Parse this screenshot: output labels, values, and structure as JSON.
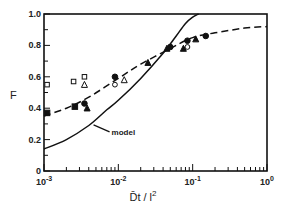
{
  "chart_data": {
    "type": "scatter",
    "title": "",
    "xlabel": "D̄t / l²",
    "ylabel": "F",
    "xscale": "log",
    "xlim": [
      0.001,
      1.0
    ],
    "ylim": [
      0,
      1.0
    ],
    "grid": false,
    "legend": null,
    "x_tick_labels": [
      {
        "value": 0.001,
        "base": "10",
        "exp": "-3"
      },
      {
        "value": 0.01,
        "base": "10",
        "exp": "-2"
      },
      {
        "value": 0.1,
        "base": "10",
        "exp": "-1"
      },
      {
        "value": 1.0,
        "base": "10",
        "exp": "0"
      }
    ],
    "y_tick_labels": [
      {
        "value": 0,
        "label": "0"
      },
      {
        "value": 0.2,
        "label": "0.2"
      },
      {
        "value": 0.4,
        "label": "0.4"
      },
      {
        "value": 0.6,
        "label": "0.6"
      },
      {
        "value": 0.8,
        "label": "0.8"
      },
      {
        "value": 1.0,
        "label": "1.0"
      }
    ],
    "annotations": [
      {
        "text": "model",
        "points_to": "solid curve",
        "x": 0.0045,
        "y": 0.3
      }
    ],
    "series": [
      {
        "name": "filled squares",
        "marker": "square-filled",
        "points": [
          [
            0.0011,
            0.37
          ],
          [
            0.0026,
            0.41
          ]
        ]
      },
      {
        "name": "filled circles",
        "marker": "circle-filled",
        "points": [
          [
            0.0035,
            0.43
          ],
          [
            0.009,
            0.6
          ],
          [
            0.05,
            0.79
          ],
          [
            0.085,
            0.83
          ],
          [
            0.15,
            0.86
          ]
        ]
      },
      {
        "name": "filled triangles",
        "marker": "triangle-filled",
        "points": [
          [
            0.0038,
            0.4
          ],
          [
            0.025,
            0.69
          ],
          [
            0.045,
            0.78
          ],
          [
            0.075,
            0.78
          ],
          [
            0.11,
            0.84
          ]
        ]
      },
      {
        "name": "open squares",
        "marker": "square-open",
        "points": [
          [
            0.0011,
            0.55
          ],
          [
            0.0025,
            0.57
          ],
          [
            0.0035,
            0.6
          ]
        ]
      },
      {
        "name": "open triangles",
        "marker": "triangle-open",
        "points": [
          [
            0.0035,
            0.55
          ],
          [
            0.012,
            0.58
          ]
        ]
      },
      {
        "name": "open circles",
        "marker": "circle-open",
        "points": [
          [
            0.009,
            0.55
          ],
          [
            0.085,
            0.79
          ]
        ]
      },
      {
        "name": "model",
        "style": "solid-line",
        "points": [
          [
            0.001,
            0.14
          ],
          [
            0.002,
            0.2
          ],
          [
            0.004,
            0.29
          ],
          [
            0.007,
            0.39
          ],
          [
            0.01,
            0.45
          ],
          [
            0.02,
            0.59
          ],
          [
            0.04,
            0.75
          ],
          [
            0.06,
            0.86
          ],
          [
            0.08,
            0.94
          ],
          [
            0.1,
            0.98
          ],
          [
            0.12,
            1.0
          ]
        ]
      },
      {
        "name": "dashed fit",
        "style": "dashed-line",
        "points": [
          [
            0.001,
            0.35
          ],
          [
            0.002,
            0.4
          ],
          [
            0.004,
            0.47
          ],
          [
            0.01,
            0.59
          ],
          [
            0.02,
            0.68
          ],
          [
            0.05,
            0.78
          ],
          [
            0.1,
            0.85
          ],
          [
            0.2,
            0.88
          ],
          [
            0.5,
            0.91
          ],
          [
            1.0,
            0.92
          ]
        ]
      }
    ]
  },
  "colors": {
    "ink": "#111111",
    "background": "#ffffff"
  }
}
